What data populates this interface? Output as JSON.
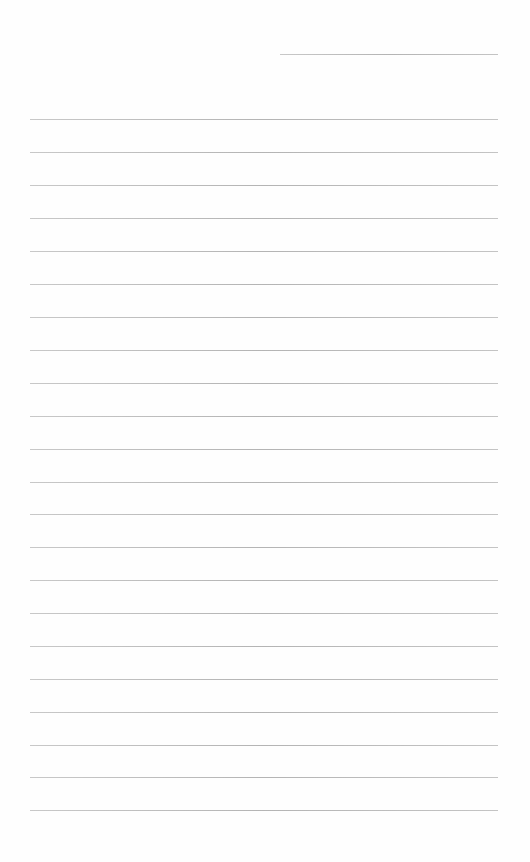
{
  "page": {
    "type": "lined-paper",
    "background_color": "#fefefe",
    "line_color": "#bdbdbd",
    "header_line": {
      "x": 280,
      "y": 54,
      "width": 218
    },
    "ruled_lines": {
      "x": 30,
      "width": 468,
      "y_positions": [
        119,
        152,
        185,
        218,
        251,
        284,
        317,
        350,
        383,
        416,
        449,
        482,
        514,
        547,
        580,
        613,
        646,
        679,
        712,
        745,
        777,
        810
      ]
    }
  }
}
